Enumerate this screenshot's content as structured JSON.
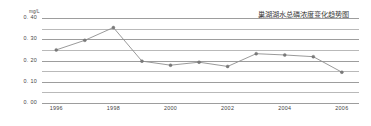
{
  "chart_data": {
    "type": "line",
    "title": "巢湖湖水总磷浓度变化趋势图",
    "unit_label": "mg/L",
    "xlabel": "",
    "ylabel": "",
    "ylim": [
      0.0,
      0.4
    ],
    "ytick_labels": [
      "0. 40",
      "0. 30",
      "0. 20",
      "0. 10",
      "0. 00"
    ],
    "ytick_values": [
      0.4,
      0.3,
      0.2,
      0.1,
      0.0
    ],
    "gridlines": [
      0.4,
      0.35,
      0.3,
      0.25,
      0.2,
      0.15,
      0.1,
      0.05,
      0.0
    ],
    "grid": true,
    "legend": "none",
    "xtick_labels": [
      "1996",
      "1998",
      "2000",
      "2002",
      "2004",
      "2006"
    ],
    "xtick_values": [
      1996,
      1998,
      2000,
      2002,
      2004,
      2006
    ],
    "xlim": [
      1995.5,
      2006.6
    ],
    "categories": [
      1996,
      1997,
      1998,
      1999,
      2000,
      2001,
      2002,
      2003,
      2004,
      2005,
      2006
    ],
    "values": [
      0.25,
      0.295,
      0.355,
      0.197,
      0.178,
      0.192,
      0.172,
      0.232,
      0.226,
      0.218,
      0.145
    ],
    "series": [
      {
        "name": "总磷浓度",
        "color": "#8e8e8e",
        "marker_color": "#7a7a7a",
        "values": [
          0.25,
          0.295,
          0.355,
          0.197,
          0.178,
          0.192,
          0.172,
          0.232,
          0.226,
          0.218,
          0.145
        ]
      }
    ]
  },
  "colors": {
    "background": "#ffffff",
    "grid": "#b9b9b9",
    "line": "#8e8e8e",
    "text": "#3f3f3f"
  }
}
